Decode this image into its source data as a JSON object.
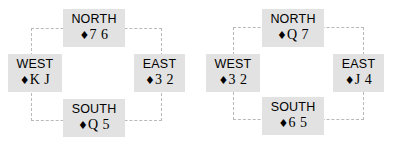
{
  "diagram_type": "bridge-hand-compass",
  "suit_symbol": "♦",
  "box_color": "#e2e2e2",
  "dash_color": "#b9b9b9",
  "text_color": "#000000",
  "background": "#ffffff",
  "diagrams": [
    {
      "name": "left-deal",
      "hands": {
        "north": {
          "label": "NORTH",
          "suit": "♦",
          "ranks": "7 6"
        },
        "west": {
          "label": "WEST",
          "suit": "♦",
          "ranks": "K J"
        },
        "east": {
          "label": "EAST",
          "suit": "♦",
          "ranks": "3 2"
        },
        "south": {
          "label": "SOUTH",
          "suit": "♦",
          "ranks": "Q 5"
        }
      }
    },
    {
      "name": "right-deal",
      "hands": {
        "north": {
          "label": "NORTH",
          "suit": "♦",
          "ranks": "Q 7"
        },
        "west": {
          "label": "WEST",
          "suit": "♦",
          "ranks": "3 2"
        },
        "east": {
          "label": "EAST",
          "suit": "♦",
          "ranks": "J 4"
        },
        "south": {
          "label": "SOUTH",
          "suit": "♦",
          "ranks": "6 5"
        }
      }
    }
  ]
}
